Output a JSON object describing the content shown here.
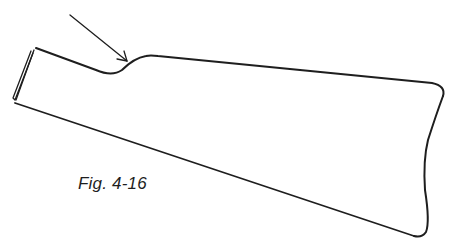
{
  "figure": {
    "caption": "Fig. 4-16",
    "stroke_color": "#1e1e1e",
    "background": "#ffffff"
  },
  "annotations": [
    {
      "type": "arrow",
      "points_to": "wrist-dip",
      "from": [
        70,
        15
      ],
      "to": [
        127,
        61
      ]
    }
  ]
}
